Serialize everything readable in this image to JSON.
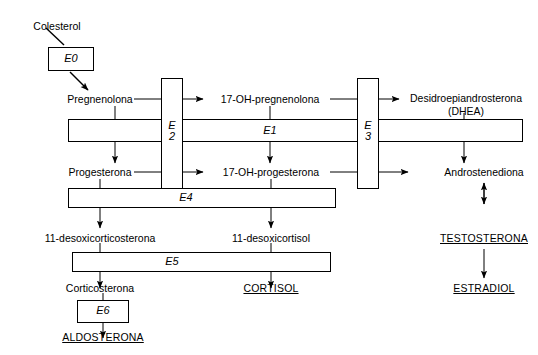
{
  "diagram": {
    "background_color": "#ffffff",
    "stroke_color": "#000000"
  },
  "metabolites": {
    "colesterol": "Colesterol",
    "pregnenolona": "Pregnenolona",
    "hidroxipregnenolona": "17-OH-pregnenolona",
    "dhea_line1": "Desidroepiandrosterona",
    "dhea_line2": "(DHEA)",
    "progesterona": "Progesterona",
    "hidroxiprogesterona": "17-OH-progesterona",
    "androstenediona": "Androstenediona",
    "desoxicorticosterona": "11-desoxicorticosterona",
    "desoxicortisol": "11-desoxicortisol",
    "testosterona": "TESTOSTERONA",
    "corticosterona": "Corticosterona",
    "cortisol": "CORTISOL",
    "estradiol": "ESTRADIOL",
    "aldosterona": "ALDOSTERONA"
  },
  "enzymes": {
    "e0": "E0",
    "e1": "E1",
    "e2_line1": "E",
    "e2_line2": "2",
    "e3_line1": "E",
    "e3_line2": "3",
    "e4": "E4",
    "e5": "E5",
    "e6": "E6"
  }
}
